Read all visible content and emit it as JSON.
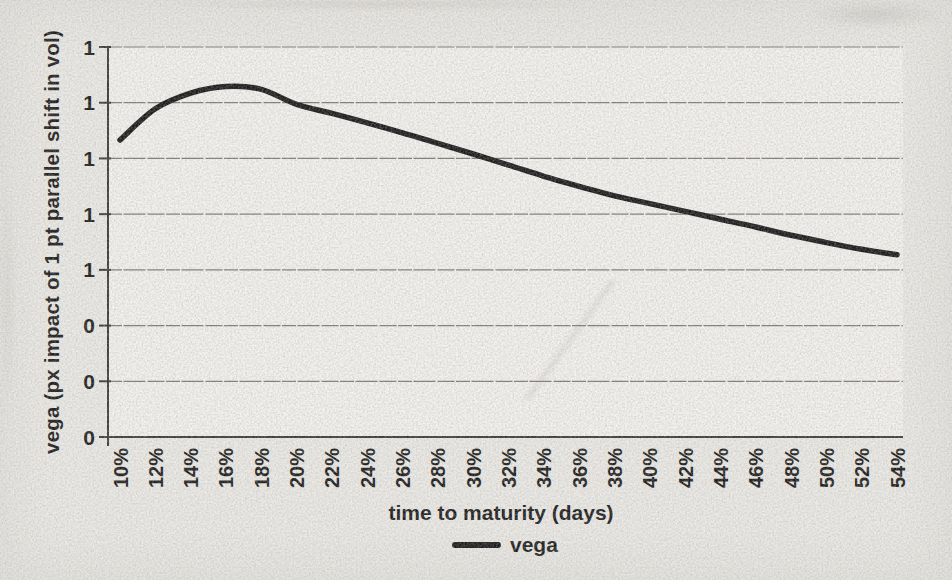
{
  "chart_data": {
    "type": "line",
    "title": "",
    "xlabel": "time to maturity (days)",
    "ylabel": "vega (px impact of 1 pt parallel shift in vol)",
    "categories": [
      "10%",
      "12%",
      "14%",
      "16%",
      "18%",
      "20%",
      "22%",
      "24%",
      "26%",
      "28%",
      "30%",
      "32%",
      "34%",
      "36%",
      "38%",
      "40%",
      "42%",
      "44%",
      "46%",
      "48%",
      "50%",
      "52%",
      "54%"
    ],
    "series": [
      {
        "name": "vega",
        "color": "#1c1c1c",
        "value_units": "gridline units: 0 = bottom axis, 7 = top gridline (printed tick labels are truncated in the scan)",
        "values": [
          5.33,
          5.89,
          6.17,
          6.29,
          6.24,
          5.97,
          5.81,
          5.64,
          5.46,
          5.27,
          5.08,
          4.88,
          4.68,
          4.5,
          4.33,
          4.19,
          4.05,
          3.91,
          3.77,
          3.62,
          3.49,
          3.37,
          3.27
        ]
      }
    ],
    "y_axis": {
      "tick_labels_top_to_bottom": [
        "1",
        "1",
        "1",
        "1",
        "1",
        "0",
        "0",
        "0"
      ],
      "range_gridline_units": [
        0,
        7
      ],
      "gridlines": true
    },
    "x_axis": {
      "tick_label_rotation_deg": -90
    },
    "grid": "horizontal",
    "legend_position": "bottom",
    "legend": {
      "entries": [
        {
          "label": "vega",
          "swatch": "thick-line",
          "color": "#1c1c1c"
        }
      ]
    }
  }
}
